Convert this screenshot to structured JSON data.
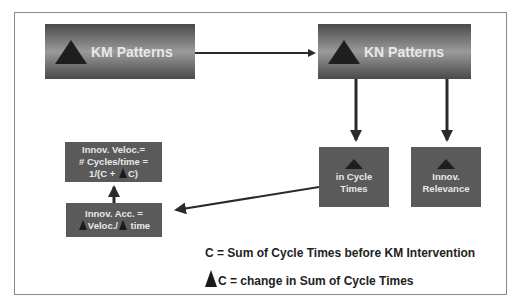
{
  "diagram": {
    "nodes": {
      "km_patterns": {
        "label": "KM Patterns",
        "icon": "delta-triangle"
      },
      "kn_patterns": {
        "label": "KN Patterns",
        "icon": "delta-triangle"
      },
      "cycle_times": {
        "icon": "delta-triangle",
        "line1": "in Cycle",
        "line2": "Times"
      },
      "innov_relevance": {
        "icon": "delta-triangle",
        "line1": "Innov.",
        "line2": "Relevance"
      },
      "innov_velocity": {
        "line1": "Innov. Veloc.=",
        "line2": "# Cycles/time =",
        "line3_pre": "1/(C + ",
        "line3_post": "C)"
      },
      "innov_acceleration": {
        "line1": "Innov. Acc. =",
        "line2_a": "Veloc./",
        "line2_b": " time"
      }
    },
    "edges": [
      {
        "from": "km_patterns",
        "to": "kn_patterns"
      },
      {
        "from": "kn_patterns",
        "to": "cycle_times"
      },
      {
        "from": "kn_patterns",
        "to": "innov_relevance"
      },
      {
        "from": "cycle_times",
        "to": "innov_acceleration"
      },
      {
        "from": "innov_acceleration",
        "to": "innov_velocity"
      }
    ],
    "legend": {
      "line1": "C = Sum of Cycle Times before KM Intervention",
      "line2": "C = change in Sum of Cycle Times"
    },
    "colors": {
      "box_dark": "#4a4a4a",
      "box_light": "#9a9a9a",
      "small_box": "#5a5a5a",
      "text": "#e8e8e8",
      "arrow": "#2a2a2a"
    }
  }
}
